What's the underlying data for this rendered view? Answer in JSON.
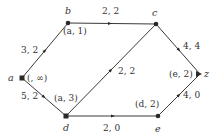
{
  "diagram": {
    "type": "flow-network",
    "nodes": [
      {
        "id": "a",
        "label": "a",
        "mark": "(, ∞)",
        "x": 22,
        "y": 78
      },
      {
        "id": "b",
        "label": "b",
        "mark": "(a, 1)",
        "x": 68,
        "y": 23
      },
      {
        "id": "c",
        "label": "c",
        "mark": "",
        "x": 156,
        "y": 24
      },
      {
        "id": "d",
        "label": "d",
        "mark": "(a, 3)",
        "x": 66,
        "y": 116
      },
      {
        "id": "e",
        "label": "e",
        "mark": "(d, 2)",
        "x": 158,
        "y": 116
      },
      {
        "id": "z",
        "label": "z",
        "mark": "(e, 2)",
        "x": 200,
        "y": 74
      }
    ],
    "edges": [
      {
        "from": "a",
        "to": "b",
        "label": "3, 2"
      },
      {
        "from": "b",
        "to": "c",
        "label": "2, 2"
      },
      {
        "from": "a",
        "to": "d",
        "label": "5, 2"
      },
      {
        "from": "d",
        "to": "c",
        "label": "2, 2"
      },
      {
        "from": "d",
        "to": "e",
        "label": "2, 0"
      },
      {
        "from": "c",
        "to": "z",
        "label": "4, 4"
      },
      {
        "from": "e",
        "to": "z",
        "label": "4, 0"
      }
    ]
  },
  "labels": {
    "node_a": "a",
    "node_b": "b",
    "node_c": "c",
    "node_d": "d",
    "node_e": "e",
    "node_z": "z",
    "mark_a": "(, ∞)",
    "mark_b": "(a, 1)",
    "mark_d": "(a, 3)",
    "mark_e": "(d, 2)",
    "mark_z": "(e, 2)",
    "edge_ab": "3, 2",
    "edge_bc": "2, 2",
    "edge_ad": "5, 2",
    "edge_dc": "2, 2",
    "edge_de": "2, 0",
    "edge_cz": "4, 4",
    "edge_ez": "4, 0"
  }
}
